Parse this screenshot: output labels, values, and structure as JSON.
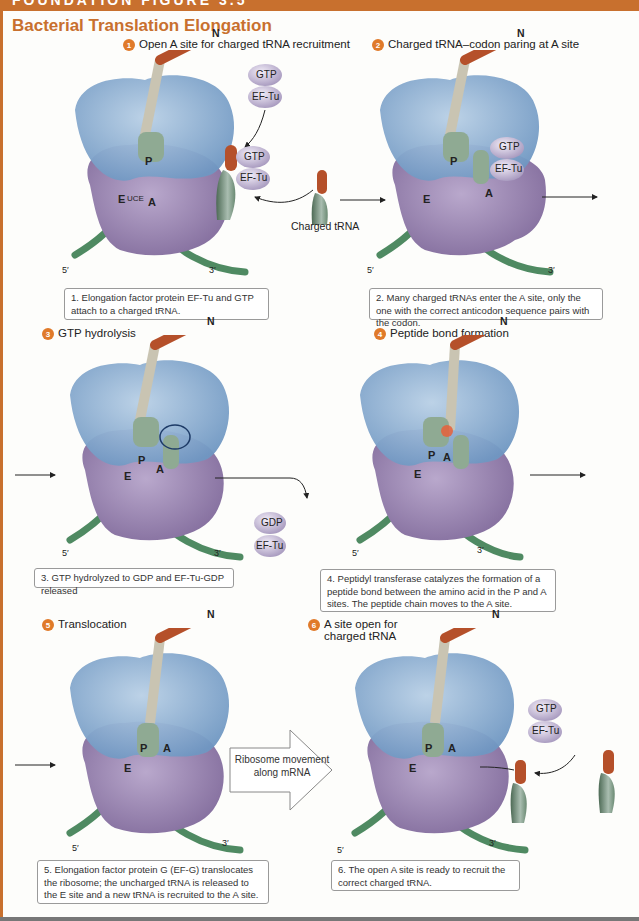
{
  "header": {
    "figure_label": "FOUNDATION FIGURE 3.5",
    "title": "Bacterial Translation Elongation"
  },
  "colors": {
    "accent": "#c8702e",
    "step_badge": "#e07a2a",
    "ribosome_large": "#8fb3d6",
    "ribosome_small": "#9c88b0",
    "mrna": "#5f9a70",
    "peptide": "#b5502a",
    "factor": "#c9c0d8"
  },
  "steps": [
    {
      "number": "1",
      "title": "Open A site for charged tRNA recruitment",
      "caption": "1. Elongation factor protein EF-Tu and GTP attach to a charged tRNA.",
      "labels": {
        "n_term": "N",
        "five_prime": "5′",
        "three_prime": "3′",
        "site_e": "E",
        "site_p": "P",
        "site_a": "A",
        "anticodon": "UCE",
        "mrna_seq": "AGACGCCAGCCA AGAC",
        "factor_top": "GTP",
        "factor_bottom": "EF-Tu",
        "trna_aa": "Gln",
        "extra_label": "Charged tRNA"
      },
      "peptide": [
        "fMet",
        "Arg",
        "Pro",
        "Ala",
        "Ser"
      ]
    },
    {
      "number": "2",
      "title": "Charged tRNA–codon paring at A site",
      "caption": "2. Many charged tRNAs enter the A site, only the one with the correct anticodon sequence pairs with the codon.",
      "labels": {
        "n_term": "N",
        "five_prime": "5′",
        "three_prime": "3′",
        "site_e": "E",
        "site_p": "P",
        "site_a": "A",
        "anticodon": "UCGGUU",
        "mrna_seq": "AGACGCCAGCCA AGAC",
        "factor_top": "GTP",
        "factor_bottom": "EF-Tu"
      },
      "peptide": [
        "fMet",
        "Arg",
        "Pro",
        "Ala",
        "Ser",
        "Gln"
      ]
    },
    {
      "number": "3",
      "title": "GTP hydrolysis",
      "caption": "3. GTP hydrolyzed to GDP and EF-Tu-GDP released",
      "labels": {
        "n_term": "N",
        "five_prime": "5′",
        "three_prime": "3′",
        "site_e": "E",
        "site_p": "P",
        "site_a": "A",
        "anticodon": "UCGGUU",
        "mrna_seq": "AGACGCCAGCCA AGAC",
        "factor_top": "GDP",
        "factor_bottom": "EF-Tu"
      },
      "peptide": [
        "fMet",
        "Arg",
        "Pro",
        "Ala",
        "Ser",
        "Gln"
      ]
    },
    {
      "number": "4",
      "title": "Peptide bond formation",
      "caption": "4. Peptidyl transferase catalyzes the formation of a peptide bond between the amino acid in the P and A sites. The peptide chain moves to the A site.",
      "labels": {
        "n_term": "N",
        "five_prime": "5′",
        "three_prime": "3′",
        "site_e": "E",
        "site_p": "P",
        "site_a": "A",
        "anticodon": "UCGGUU",
        "mrna_seq": "AGACGCCAGCCA AGAC"
      },
      "peptide": [
        "fMet",
        "Arg",
        "Pro",
        "Ala",
        "Ser",
        "Gln"
      ]
    },
    {
      "number": "5",
      "title": "Translocation",
      "caption": "5. Elongation factor protein G (EF-G) translocates the ribosome; the uncharged tRNA is released to the E site and a new tRNA is recruited to the A site.",
      "labels": {
        "n_term": "N",
        "five_prime": "5′",
        "three_prime": "3′",
        "site_e": "E",
        "site_p": "P",
        "site_a": "A",
        "anticodon": "UCGGUU",
        "mrna_seq": "AGACGCCAGCCA AGAC",
        "arrow_text": "Ribosome movement along mRNA"
      },
      "peptide": [
        "fMet",
        "Arg",
        "Pro",
        "Ala",
        "Ser",
        "Gln"
      ]
    },
    {
      "number": "6",
      "title": "A site open for charged tRNA",
      "caption": "6. The open A site is ready to recruit the correct charged tRNA.",
      "labels": {
        "n_term": "N",
        "five_prime": "5′",
        "three_prime": "3′",
        "site_e": "E",
        "site_p": "P",
        "site_a": "A",
        "anticodon": "UCGGUU",
        "mrna_seq": "AGACGCCAGCCA AGAC",
        "factor_top": "GTP",
        "factor_bottom": "EF-Tu",
        "trna_aa": "Asp"
      },
      "peptide": [
        "fMet",
        "Arg",
        "Pro",
        "Ala",
        "Ser",
        "Gln"
      ]
    }
  ]
}
